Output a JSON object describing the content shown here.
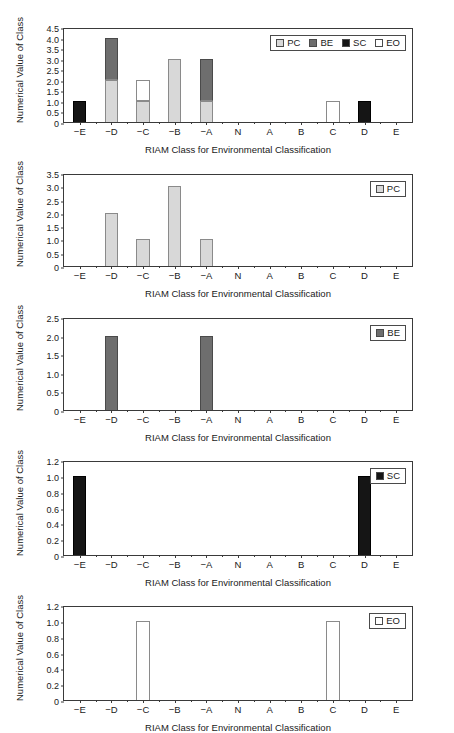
{
  "figure": {
    "width": 454,
    "height": 733,
    "background": "#ffffff",
    "panel_count": 5
  },
  "colors": {
    "pc": "#d8d8d8",
    "be": "#6e6e6e",
    "sc": "#151515",
    "eo": "#ffffff",
    "axis": "#3a3a3a",
    "text": "#1a1a1a"
  },
  "axis_titles": {
    "x": "RIAM Class for Environmental Classification",
    "y": "Numerical Value of Class"
  },
  "categories": [
    "−E",
    "−D",
    "−C",
    "−B",
    "−A",
    "N",
    "A",
    "B",
    "C",
    "D",
    "E"
  ],
  "series_names": {
    "pc": "PC",
    "be": "BE",
    "sc": "SC",
    "eo": "EO"
  },
  "chart_data": [
    {
      "type": "bar",
      "id": "panel-1-all",
      "title": "",
      "stacked": true,
      "xlabel": "RIAM Class for Environmental Classification",
      "ylabel": "Numerical Value of Class",
      "categories": [
        "−E",
        "−D",
        "−C",
        "−B",
        "−A",
        "N",
        "A",
        "B",
        "C",
        "D",
        "E"
      ],
      "ylim": [
        0,
        4.5
      ],
      "yticks": [
        "0",
        "0.5",
        "1.0",
        "1.5",
        "2.0",
        "2.5",
        "3.0",
        "3.5",
        "4.0",
        "4.5"
      ],
      "ytick_values": [
        0,
        0.5,
        1.0,
        1.5,
        2.0,
        2.5,
        3.0,
        3.5,
        4.0,
        4.5
      ],
      "grid": false,
      "legend_position": "top-right",
      "series": [
        {
          "name": "PC",
          "key": "pc",
          "color": "#d8d8d8",
          "values": [
            0,
            2,
            1,
            3,
            1,
            0,
            0,
            0,
            0,
            0,
            0
          ]
        },
        {
          "name": "BE",
          "key": "be",
          "color": "#6e6e6e",
          "values": [
            0,
            2,
            0,
            0,
            2,
            0,
            0,
            0,
            0,
            0,
            0
          ]
        },
        {
          "name": "SC",
          "key": "sc",
          "color": "#151515",
          "values": [
            1,
            0,
            0,
            0,
            0,
            0,
            0,
            0,
            0,
            1,
            0
          ]
        },
        {
          "name": "EO",
          "key": "eo",
          "color": "#ffffff",
          "values": [
            0,
            0,
            1,
            0,
            0,
            0,
            0,
            0,
            1,
            0,
            0
          ]
        }
      ],
      "totals": [
        1,
        4,
        2,
        3,
        3,
        0,
        0,
        0,
        0,
        1,
        0
      ]
    },
    {
      "type": "bar",
      "id": "panel-2-pc",
      "title": "",
      "stacked": false,
      "xlabel": "RIAM Class for Environmental Classification",
      "ylabel": "Numerical Value of Class",
      "categories": [
        "−E",
        "−D",
        "−C",
        "−B",
        "−A",
        "N",
        "A",
        "B",
        "C",
        "D",
        "E"
      ],
      "ylim": [
        0,
        3.5
      ],
      "yticks": [
        "0",
        "0.5",
        "1.0",
        "1.5",
        "2.0",
        "2.5",
        "3.0",
        "3.5"
      ],
      "ytick_values": [
        0,
        0.5,
        1.0,
        1.5,
        2.0,
        2.5,
        3.0,
        3.5
      ],
      "grid": false,
      "legend_position": "top-right",
      "series": [
        {
          "name": "PC",
          "key": "pc",
          "color": "#d8d8d8",
          "values": [
            0,
            2,
            1,
            3,
            1,
            0,
            0,
            0,
            0,
            0,
            0
          ]
        }
      ]
    },
    {
      "type": "bar",
      "id": "panel-3-be",
      "title": "",
      "stacked": false,
      "xlabel": "RIAM Class for Environmental Classification",
      "ylabel": "Numerical Value of Class",
      "categories": [
        "−E",
        "−D",
        "−C",
        "−B",
        "−A",
        "N",
        "A",
        "B",
        "C",
        "D",
        "E"
      ],
      "ylim": [
        0,
        2.5
      ],
      "yticks": [
        "0",
        "0.5",
        "1.0",
        "1.5",
        "2.0",
        "2.5"
      ],
      "ytick_values": [
        0,
        0.5,
        1.0,
        1.5,
        2.0,
        2.5
      ],
      "grid": false,
      "legend_position": "top-right",
      "series": [
        {
          "name": "BE",
          "key": "be",
          "color": "#6e6e6e",
          "values": [
            0,
            2,
            0,
            0,
            2,
            0,
            0,
            0,
            0,
            0,
            0
          ]
        }
      ]
    },
    {
      "type": "bar",
      "id": "panel-4-sc",
      "title": "",
      "stacked": false,
      "xlabel": "RIAM Class for Environmental Classification",
      "ylabel": "Numerical Value of Class",
      "categories": [
        "−E",
        "−D",
        "−C",
        "−B",
        "−A",
        "N",
        "A",
        "B",
        "C",
        "D",
        "E"
      ],
      "ylim": [
        0,
        1.2
      ],
      "yticks": [
        "0",
        "0.2",
        "0.4",
        "0.6",
        "0.8",
        "1.0",
        "1.2"
      ],
      "ytick_values": [
        0,
        0.2,
        0.4,
        0.6,
        0.8,
        1.0,
        1.2
      ],
      "grid": false,
      "legend_position": "top-right",
      "series": [
        {
          "name": "SC",
          "key": "sc",
          "color": "#151515",
          "values": [
            1,
            0,
            0,
            0,
            0,
            0,
            0,
            0,
            0,
            1,
            0
          ]
        }
      ]
    },
    {
      "type": "bar",
      "id": "panel-5-eo",
      "title": "",
      "stacked": false,
      "xlabel": "RIAM Class for Environmental Classification",
      "ylabel": "Numerical Value of Class",
      "categories": [
        "−E",
        "−D",
        "−C",
        "−B",
        "−A",
        "N",
        "A",
        "B",
        "C",
        "D",
        "E"
      ],
      "ylim": [
        0,
        1.2
      ],
      "yticks": [
        "0",
        "0.2",
        "0.4",
        "0.6",
        "0.8",
        "1.0",
        "1.2"
      ],
      "ytick_values": [
        0,
        0.2,
        0.4,
        0.6,
        0.8,
        1.0,
        1.2
      ],
      "grid": false,
      "legend_position": "top-right",
      "series": [
        {
          "name": "EO",
          "key": "eo",
          "color": "#ffffff",
          "values": [
            0,
            0,
            1,
            0,
            0,
            0,
            0,
            0,
            1,
            0,
            0
          ]
        }
      ]
    }
  ],
  "panel_geometry": [
    {
      "top": 28,
      "plot_height": 95
    },
    {
      "top": 174,
      "plot_height": 93
    },
    {
      "top": 318,
      "plot_height": 93
    },
    {
      "top": 461,
      "plot_height": 95
    },
    {
      "top": 606,
      "plot_height": 95
    }
  ]
}
